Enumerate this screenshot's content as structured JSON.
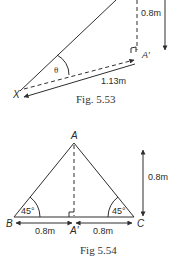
{
  "figures": [
    {
      "id": "fig_5_53",
      "caption": "Fig. 5.53",
      "labels": {
        "vertex_x": "X",
        "vertex_a_prime": "A′",
        "angle": "θ",
        "horizontal_length": "1.13m",
        "vertical_length": "0.8m"
      }
    },
    {
      "id": "fig_5_54",
      "caption": "Fig 5.54",
      "labels": {
        "vertex_a": "A",
        "vertex_b": "B",
        "vertex_c": "C",
        "vertex_a_prime": "A′",
        "angle_left": "45°",
        "angle_right": "45°",
        "height": "0.8m",
        "left_base": "0.8m",
        "right_base": "0.8m"
      }
    }
  ]
}
